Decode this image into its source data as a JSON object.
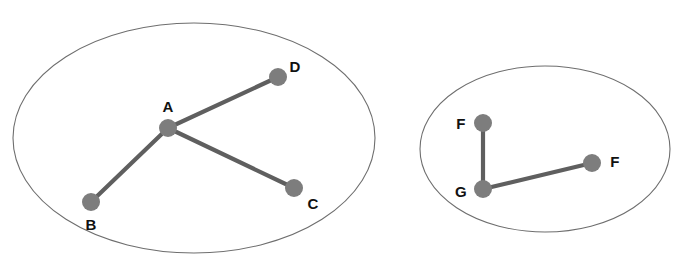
{
  "diagram": {
    "type": "node-link-diagram",
    "width": 682,
    "height": 267,
    "background_color": "#ffffff",
    "node_color": "#7d7d7d",
    "edge_color": "#5f5f5f",
    "boundary_color": "#6e6e6e",
    "label_color": "#111111",
    "node_radius": 9,
    "edge_width": 4.2,
    "groups": [
      {
        "id": "component-1",
        "name": "left-component",
        "shape": "ellipse",
        "cx": 194,
        "cy": 138,
        "rx": 181,
        "ry": 115,
        "nodes": [
          {
            "id": "A",
            "label": "A",
            "x": 168,
            "y": 128,
            "label_x": 168,
            "label_y": 106
          },
          {
            "id": "B",
            "label": "B",
            "x": 91,
            "y": 202,
            "label_x": 91,
            "label_y": 224
          },
          {
            "id": "C",
            "label": "C",
            "x": 294,
            "y": 188,
            "label_x": 313,
            "label_y": 203
          },
          {
            "id": "D",
            "label": "D",
            "x": 278,
            "y": 77,
            "label_x": 295,
            "label_y": 66
          }
        ],
        "edges": [
          {
            "from": "A",
            "to": "B"
          },
          {
            "from": "A",
            "to": "C"
          },
          {
            "from": "A",
            "to": "D"
          }
        ]
      },
      {
        "id": "component-2",
        "name": "right-component",
        "shape": "ellipse",
        "cx": 545,
        "cy": 149,
        "rx": 125,
        "ry": 83,
        "nodes": [
          {
            "id": "F1",
            "label": "F",
            "x": 483,
            "y": 123,
            "label_x": 461,
            "label_y": 123
          },
          {
            "id": "G",
            "label": "G",
            "x": 483,
            "y": 189,
            "label_x": 461,
            "label_y": 191
          },
          {
            "id": "F2",
            "label": "F",
            "x": 592,
            "y": 163,
            "label_x": 615,
            "label_y": 161
          }
        ],
        "edges": [
          {
            "from": "F1",
            "to": "G"
          },
          {
            "from": "G",
            "to": "F2"
          }
        ]
      }
    ]
  }
}
